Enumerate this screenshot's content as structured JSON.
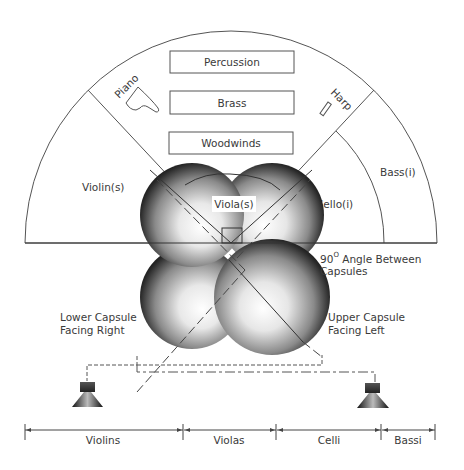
{
  "diagram": {
    "type": "orchestra seating with stereo microphone capsule layout",
    "sections_back": [
      {
        "label": "Percussion"
      },
      {
        "label": "Brass"
      },
      {
        "label": "Woodwinds"
      }
    ],
    "instruments_rotated": {
      "piano": "Piano",
      "harp": "Harp"
    },
    "seating_labels": {
      "violins": "Violin(s)",
      "violas": "Viola(s)",
      "cellos": "Cello(i)",
      "basses": "Bass(i)"
    },
    "annotations": {
      "angle_line1_num": "90",
      "angle_degree": "O",
      "angle_line1_rest": " Angle Between",
      "angle_line2": "Capsules",
      "lower_capsule_line1": "Lower Capsule",
      "lower_capsule_line2": "Facing Right",
      "upper_capsule_line1": "Upper Capsule",
      "upper_capsule_line2": "Facing Left"
    },
    "speakers": [
      {
        "name": "left-speaker"
      },
      {
        "name": "right-speaker"
      }
    ],
    "dimension_bar": [
      {
        "label": "Violins"
      },
      {
        "label": "Violas"
      },
      {
        "label": "Celli"
      },
      {
        "label": "Bassi"
      }
    ],
    "colors": {
      "line": "#555555",
      "text": "#3a3a3a",
      "sphere_light": "#ffffff",
      "sphere_dark": "#1a1a1a"
    }
  }
}
